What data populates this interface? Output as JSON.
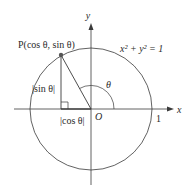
{
  "diagram": {
    "type": "unit-circle",
    "colors": {
      "stroke": "#3a3a3a",
      "point": "#555555",
      "text": "#2a2a2a",
      "background": "#ffffff"
    },
    "axes": {
      "x_label": "x",
      "y_label": "y",
      "origin_label": "O",
      "x_tick_label": "1"
    },
    "circle": {
      "equation": "x² + y² = 1"
    },
    "point": {
      "label": "P(cos θ, sin θ)"
    },
    "angle": {
      "label": "θ"
    },
    "segments": {
      "vertical_label": "|sin θ|",
      "horizontal_label": "|cos θ|"
    }
  }
}
